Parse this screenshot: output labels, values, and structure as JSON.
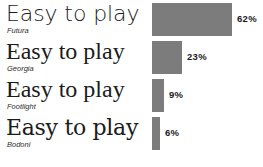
{
  "chart_data": {
    "type": "bar",
    "orientation": "horizontal",
    "title": "",
    "xlabel": "",
    "ylabel": "",
    "categories": [
      "Futura",
      "Georgia",
      "Footlight",
      "Bodoni"
    ],
    "values": [
      62,
      23,
      9,
      6
    ],
    "value_labels": [
      "62%",
      "23%",
      "9%",
      "6%"
    ],
    "value_unit": "%",
    "xlim": [
      0,
      62
    ],
    "grid": false,
    "legend": false,
    "bar_color": "#7c7c7c",
    "background_color": "#ffffff",
    "text_color": "#1b1b1b",
    "specimen_text": "Easy to play"
  },
  "rows": [
    {
      "specimen": "Easy to play",
      "font_name": "Futura",
      "value_label": "62%",
      "value": 62,
      "typeface_style": "sans"
    },
    {
      "specimen": "Easy to play",
      "font_name": "Georgia",
      "value_label": "23%",
      "value": 23,
      "typeface_style": "serif"
    },
    {
      "specimen": "Easy to play",
      "font_name": "Footlight",
      "value_label": "9%",
      "value": 9,
      "typeface_style": "serif"
    },
    {
      "specimen": "Easy to play",
      "font_name": "Bodoni",
      "value_label": "6%",
      "value": 6,
      "typeface_style": "serif-alt"
    }
  ]
}
